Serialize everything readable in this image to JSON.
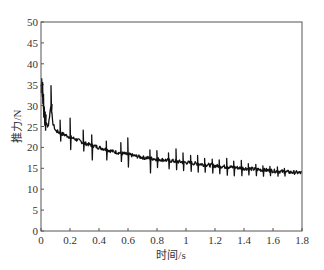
{
  "chart_data": {
    "type": "line",
    "title": "",
    "xlabel": "时间/s",
    "ylabel": "推力/N",
    "xlim": [
      0,
      1.8
    ],
    "ylim": [
      0,
      50
    ],
    "x_ticks": [
      0,
      0.2,
      0.4,
      0.6,
      0.8,
      1,
      1.2,
      1.4,
      1.6,
      1.8
    ],
    "x_tick_labels": [
      "0",
      "0.2",
      "0.4",
      "0.6",
      "0.8",
      "1",
      "1.2",
      "1.4",
      "1.6",
      "1.8"
    ],
    "y_ticks": [
      0,
      5,
      10,
      15,
      20,
      25,
      30,
      35,
      40,
      45,
      50
    ],
    "y_tick_labels": [
      "0",
      "5",
      "10",
      "15",
      "20",
      "25",
      "30",
      "35",
      "40",
      "45",
      "50"
    ],
    "grid": false,
    "legend": null,
    "series": [
      {
        "name": "推力",
        "color": "#111111",
        "x": [
          0,
          0.01,
          0.02,
          0.03,
          0.05,
          0.07,
          0.08,
          0.1,
          0.15,
          0.2,
          0.25,
          0.3,
          0.35,
          0.4,
          0.5,
          0.6,
          0.7,
          0.8,
          0.9,
          1.0,
          1.1,
          1.2,
          1.3,
          1.4,
          1.5,
          1.6,
          1.7,
          1.8
        ],
        "values": [
          35.0,
          33.5,
          28.0,
          26.0,
          25.0,
          30.5,
          26.0,
          24.0,
          23.2,
          22.5,
          21.8,
          21.0,
          20.5,
          20.0,
          19.0,
          18.3,
          17.6,
          17.2,
          16.8,
          16.4,
          16.0,
          15.6,
          15.3,
          15.0,
          14.7,
          14.4,
          14.1,
          13.9
        ]
      }
    ],
    "spikes": {
      "description": "periodic sharp up/down oscillation spikes superimposed on decaying curve",
      "times": [
        0.07,
        0.13,
        0.2,
        0.29,
        0.35,
        0.45,
        0.55,
        0.6,
        0.75,
        0.8,
        0.88,
        0.93,
        0.98,
        1.03,
        1.08,
        1.13,
        1.18,
        1.23,
        1.28,
        1.33,
        1.38,
        1.43,
        1.48,
        1.53,
        1.58,
        1.63,
        1.68
      ],
      "up_amplitude": [
        4.5,
        3,
        4.5,
        3,
        2.5,
        2,
        2.5,
        4,
        2,
        2,
        1.8,
        3,
        2.2,
        1.8,
        2,
        1.5,
        1.5,
        1.5,
        2,
        1.5,
        1.8,
        1.2,
        1.2,
        1,
        1,
        1,
        0.8
      ],
      "down_amplitude": [
        2,
        2,
        3,
        2,
        3.5,
        2.5,
        2,
        3,
        3.5,
        2,
        2,
        2,
        2,
        2,
        2,
        1.8,
        1.8,
        1.8,
        2,
        2,
        1.8,
        1.5,
        1.5,
        1.5,
        1.2,
        1.2,
        1
      ]
    }
  }
}
